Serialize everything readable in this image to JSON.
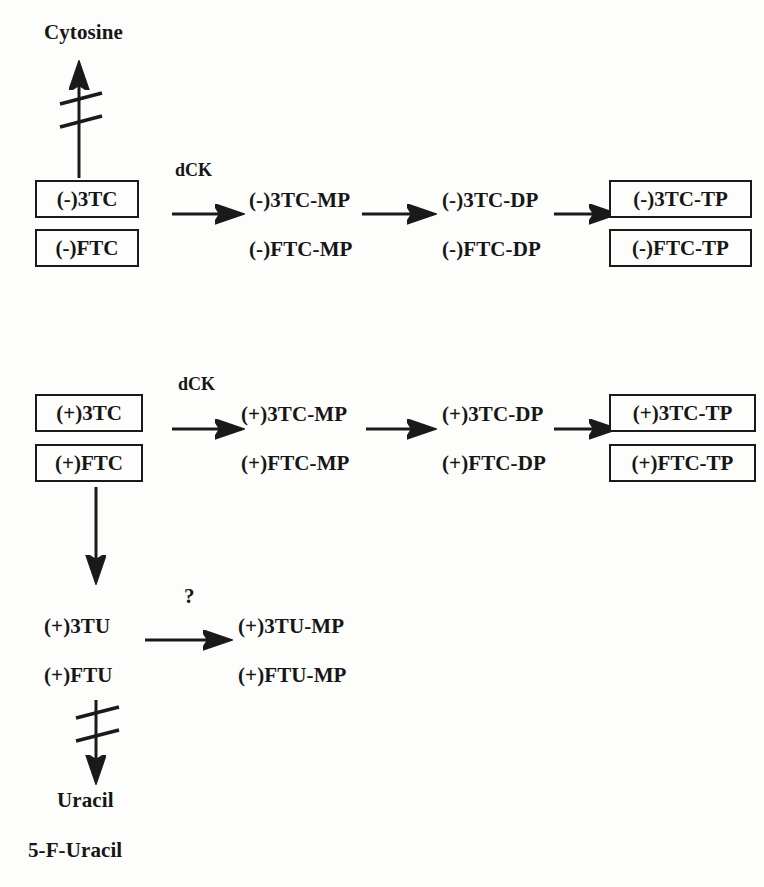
{
  "diagram": {
    "ink_color": "#1a1a1a",
    "background_color": "#fdfdfc"
  },
  "metabolites": {
    "cytosine": "Cytosine",
    "uracil": "Uracil",
    "five_f_uracil": "5-F-Uracil"
  },
  "row_minus": {
    "parent_3tc": "(-)3TC",
    "parent_ftc": "(-)FTC",
    "mp_3tc": "(-)3TC-MP",
    "mp_ftc": "(-)FTC-MP",
    "dp_3tc": "(-)3TC-DP",
    "dp_ftc": "(-)FTC-DP",
    "tp_3tc": "(-)3TC-TP",
    "tp_ftc": "(-)FTC-TP",
    "enzyme": "dCK"
  },
  "row_plus": {
    "parent_3tc": "(+)3TC",
    "parent_ftc": "(+)FTC",
    "mp_3tc": "(+)3TC-MP",
    "mp_ftc": "(+)FTC-MP",
    "dp_3tc": "(+)3TC-DP",
    "dp_ftc": "(+)FTC-DP",
    "tp_3tc": "(+)3TC-TP",
    "tp_ftc": "(+)FTC-TP",
    "enzyme": "dCK"
  },
  "row_uridine": {
    "parent_3tu": "(+)3TU",
    "parent_ftu": "(+)FTU",
    "mp_3tu": "(+)3TU-MP",
    "mp_ftu": "(+)FTU-MP",
    "enzyme": "?"
  }
}
